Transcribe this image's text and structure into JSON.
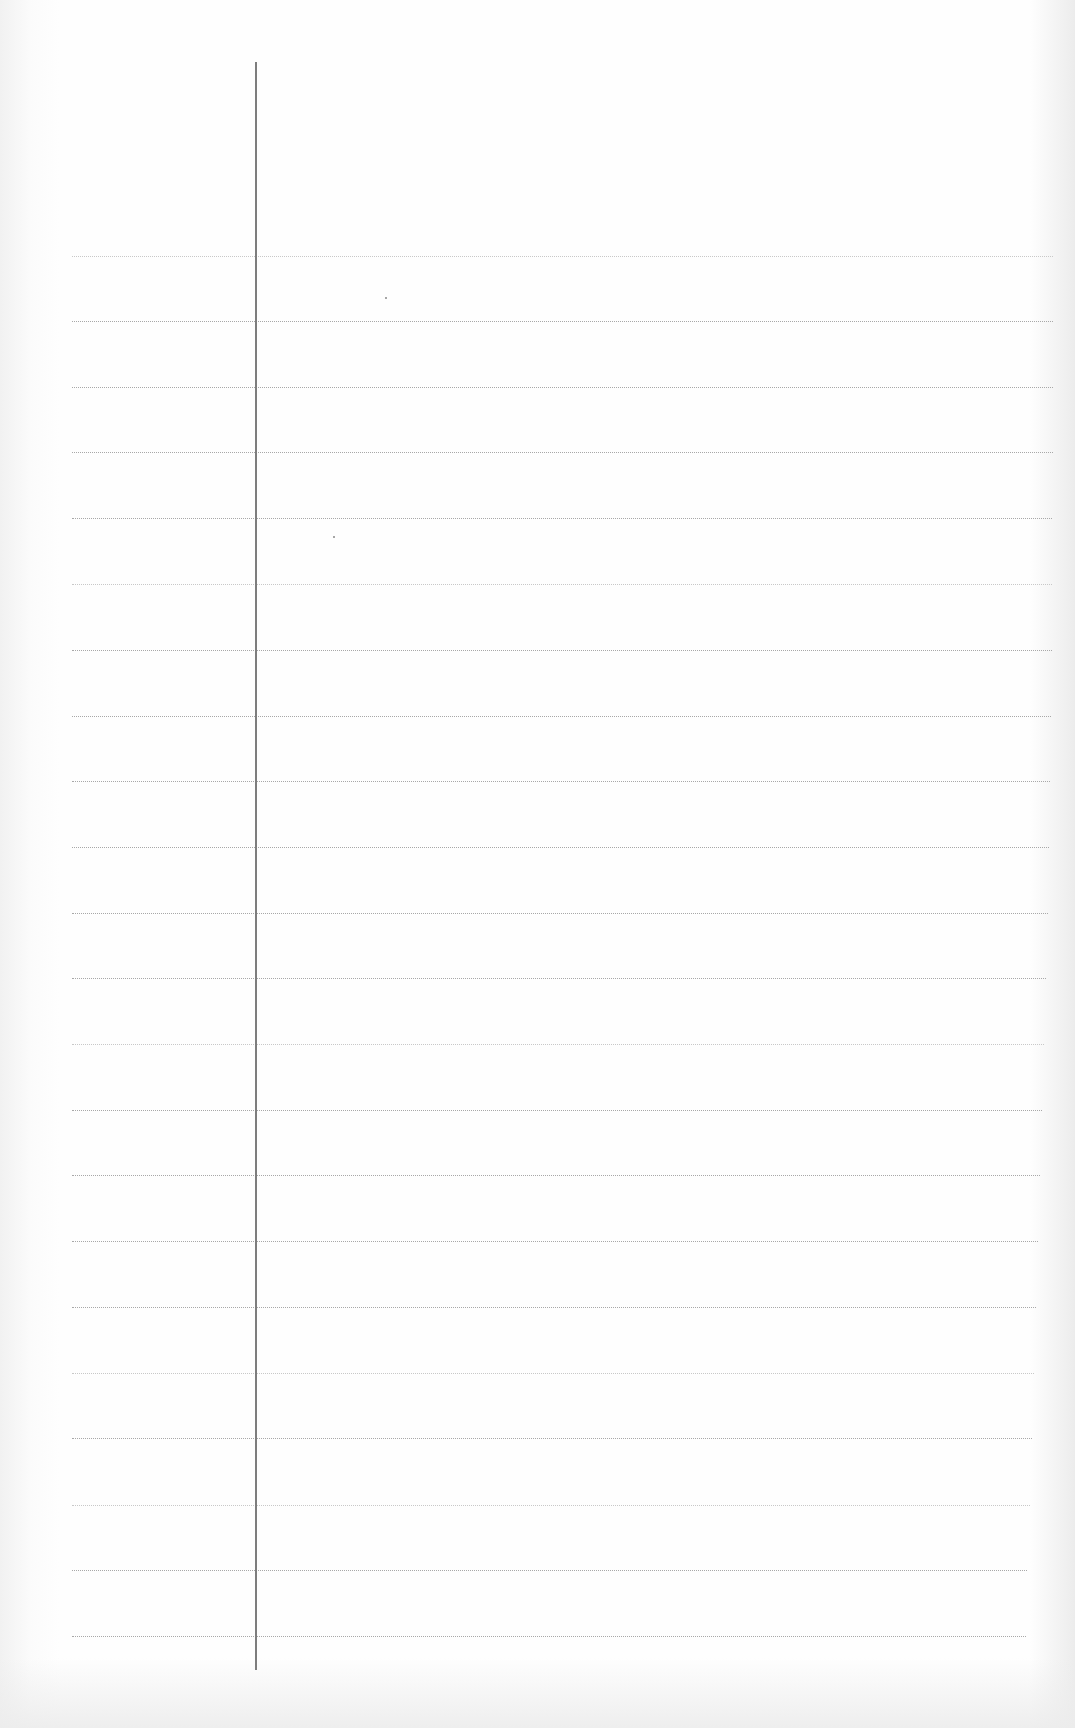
{
  "document": {
    "type": "blank lined notebook page",
    "text": ""
  },
  "layout": {
    "margin_line": {
      "x": 255,
      "top": 62,
      "bottom": 1670,
      "color": "#7d7d7d"
    },
    "rule_color": "#a8a8a8",
    "rules": [
      {
        "y": 256,
        "right": 1053,
        "faint": true
      },
      {
        "y": 321,
        "right": 1053
      },
      {
        "y": 387,
        "right": 1053
      },
      {
        "y": 452,
        "right": 1053
      },
      {
        "y": 518,
        "right": 1052
      },
      {
        "y": 584,
        "right": 1052,
        "faint": true
      },
      {
        "y": 650,
        "right": 1052
      },
      {
        "y": 716,
        "right": 1051
      },
      {
        "y": 781,
        "right": 1050
      },
      {
        "y": 847,
        "right": 1049
      },
      {
        "y": 913,
        "right": 1048
      },
      {
        "y": 978,
        "right": 1046
      },
      {
        "y": 1044,
        "right": 1044,
        "faint": true
      },
      {
        "y": 1110,
        "right": 1042
      },
      {
        "y": 1175,
        "right": 1040
      },
      {
        "y": 1241,
        "right": 1038
      },
      {
        "y": 1307,
        "right": 1036
      },
      {
        "y": 1373,
        "right": 1034,
        "faint": true
      },
      {
        "y": 1438,
        "right": 1032
      },
      {
        "y": 1505,
        "right": 1030,
        "faint": true
      },
      {
        "y": 1570,
        "right": 1027
      },
      {
        "y": 1636,
        "right": 1026
      }
    ],
    "specks": [
      {
        "x": 385,
        "y": 297
      },
      {
        "x": 333,
        "y": 536
      }
    ]
  }
}
